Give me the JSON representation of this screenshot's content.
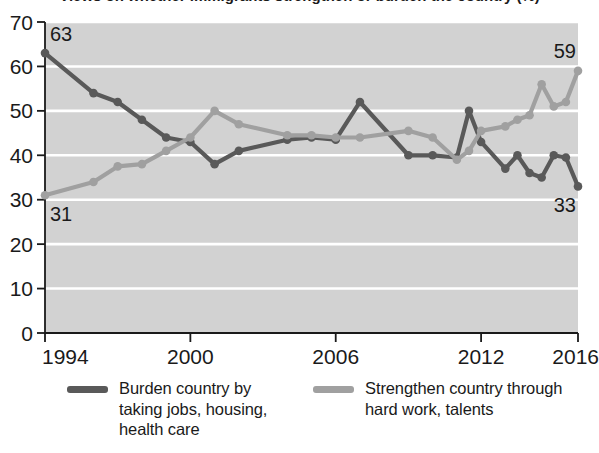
{
  "chart_data": {
    "type": "line",
    "title": "Views on whether immigrants strengthen or burden the country (%)",
    "xlabel": "",
    "ylabel": "",
    "xlim": [
      1994,
      2016
    ],
    "ylim": [
      0,
      70
    ],
    "ytick_step": 10,
    "yticks": [
      0,
      10,
      20,
      30,
      40,
      50,
      60,
      70
    ],
    "xticks": [
      1994,
      2000,
      2006,
      2012,
      2016
    ],
    "xtick_labels": [
      "1994",
      "2000",
      "2006",
      "2012",
      "2016"
    ],
    "grid": "horizontal",
    "legend_position": "bottom",
    "plot_background": "#d2d2d2",
    "gridline_color": "#ffffff",
    "series": [
      {
        "name": "Burden country by taking jobs, housing, health care",
        "color": "#595959",
        "marker": "circle",
        "endpoint_labels": {
          "start": "63",
          "end": "33"
        },
        "x": [
          1994,
          1996,
          1997,
          1998,
          1999,
          2000,
          2001,
          2002,
          2004,
          2005,
          2006,
          2007,
          2009,
          2010,
          2011,
          2011.5,
          2012,
          2013,
          2013.5,
          2014,
          2014.5,
          2015,
          2015.5,
          2016
        ],
        "values": [
          63,
          54,
          52,
          48,
          44,
          43,
          38,
          41,
          43.5,
          44,
          43.5,
          52,
          40,
          40,
          39.5,
          50,
          43,
          37,
          40,
          36,
          35,
          40,
          39.5,
          33
        ]
      },
      {
        "name": "Strengthen country through hard work, talents",
        "color": "#a0a0a0",
        "marker": "circle",
        "endpoint_labels": {
          "start": "31",
          "end": "59"
        },
        "x": [
          1994,
          1996,
          1997,
          1998,
          1999,
          2000,
          2001,
          2002,
          2004,
          2005,
          2006,
          2007,
          2009,
          2010,
          2011,
          2011.5,
          2012,
          2013,
          2013.5,
          2014,
          2014.5,
          2015,
          2015.5,
          2016
        ],
        "values": [
          31,
          34,
          37.5,
          38,
          41,
          44,
          50,
          47,
          44.5,
          44.5,
          44,
          44,
          45.5,
          44,
          39,
          41,
          45.5,
          46.5,
          48,
          49,
          56,
          51,
          52,
          59
        ]
      }
    ],
    "annotations": [
      {
        "text": "63",
        "series": "burden",
        "at": "start"
      },
      {
        "text": "31",
        "series": "strengthen",
        "at": "start"
      },
      {
        "text": "59",
        "series": "strengthen",
        "at": "end"
      },
      {
        "text": "33",
        "series": "burden",
        "at": "end"
      }
    ]
  },
  "legend": {
    "entries": [
      {
        "label": "Burden country by taking jobs, housing, health care",
        "color": "#595959"
      },
      {
        "label": "Strengthen country through hard work, talents",
        "color": "#a0a0a0"
      }
    ]
  }
}
